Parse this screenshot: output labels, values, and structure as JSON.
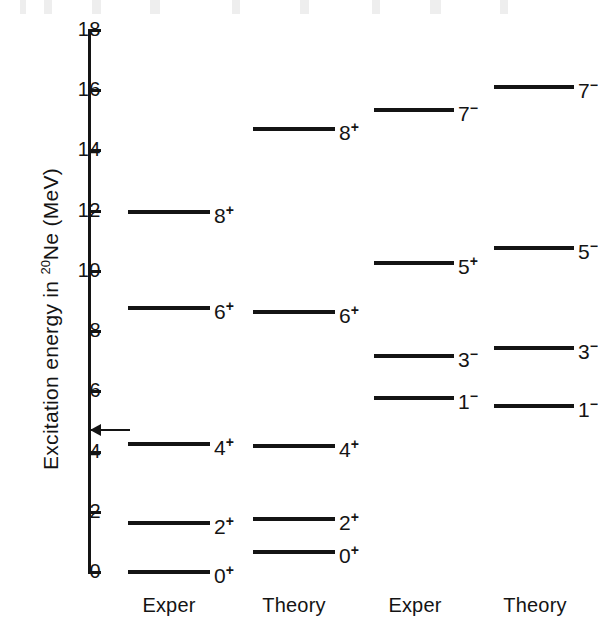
{
  "figure": {
    "nuclide": "Ne",
    "mass_number": "20",
    "y_axis_title_prefix": "Excitation  energy  in ",
    "y_axis_title_suffix": " (MeV)"
  },
  "chart_data": {
    "type": "level-diagram",
    "title": "",
    "xlabel": "",
    "ylabel": "Excitation energy in 20Ne (MeV)",
    "ylim": [
      0,
      18
    ],
    "yticks": [
      0,
      2,
      4,
      6,
      8,
      10,
      12,
      14,
      16,
      18
    ],
    "ytick_labels": [
      "0",
      "2",
      "4",
      "6",
      "8",
      "10",
      "12",
      "14",
      "16",
      "18"
    ],
    "grid": false,
    "legend": "none",
    "units": "MeV",
    "annotations": [
      {
        "name": "threshold-arrow",
        "value": 4.73,
        "label": "",
        "style": "left-pointing arrow at axis"
      }
    ],
    "columns": [
      {
        "caption": "Exper",
        "band": "K = 0+ ground state band",
        "levels": [
          {
            "label": "0",
            "parity": "+",
            "energy": 0.0
          },
          {
            "label": "2",
            "parity": "+",
            "energy": 1.63
          },
          {
            "label": "4",
            "parity": "+",
            "energy": 4.25
          },
          {
            "label": "6",
            "parity": "+",
            "energy": 8.78
          },
          {
            "label": "8",
            "parity": "+",
            "energy": 11.95
          }
        ]
      },
      {
        "caption": "Theory",
        "band": "K = 0+ ground state band",
        "levels": [
          {
            "label": "0",
            "parity": "+",
            "energy": 0.65
          },
          {
            "label": "2",
            "parity": "+",
            "energy": 1.75
          },
          {
            "label": "4",
            "parity": "+",
            "energy": 4.2
          },
          {
            "label": "6",
            "parity": "+",
            "energy": 8.62
          },
          {
            "label": "8",
            "parity": "+",
            "energy": 14.72
          }
        ]
      },
      {
        "caption": "Exper",
        "band": "K = 0- negative parity band",
        "levels": [
          {
            "label": "1",
            "parity": "−",
            "energy": 5.79
          },
          {
            "label": "3",
            "parity": "−",
            "energy": 7.17
          },
          {
            "label": "5",
            "parity": "+",
            "energy": 10.26
          },
          {
            "label": "7",
            "parity": "−",
            "energy": 15.35
          }
        ]
      },
      {
        "caption": "Theory",
        "band": "K = 0- negative parity band",
        "levels": [
          {
            "label": "1",
            "parity": "−",
            "energy": 5.52
          },
          {
            "label": "3",
            "parity": "−",
            "energy": 7.45
          },
          {
            "label": "5",
            "parity": "−",
            "energy": 10.75
          },
          {
            "label": "7",
            "parity": "−",
            "energy": 16.1
          }
        ]
      }
    ]
  }
}
